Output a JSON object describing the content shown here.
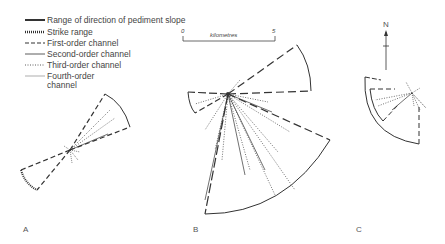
{
  "legend": {
    "items": [
      {
        "label": "Range of direction of pediment slope",
        "style": "solid-thick"
      },
      {
        "label": "Strike range",
        "style": "hatched"
      },
      {
        "label": "First-order channel",
        "style": "dashed"
      },
      {
        "label": "Second-order channel",
        "style": "solid-thin"
      },
      {
        "label": "Third-order channel",
        "style": "dotted"
      },
      {
        "label": "Fourth-order channel",
        "style": "solid-thin-grey"
      }
    ],
    "fourth_line1": "Fourth-order",
    "fourth_line2": "channel"
  },
  "scale_bar": {
    "start": "0",
    "end": "5",
    "unit": "kilometres"
  },
  "north_arrow": {
    "label": "N"
  },
  "panels": [
    {
      "id": "A",
      "label": "A"
    },
    {
      "id": "B",
      "label": "B"
    },
    {
      "id": "C",
      "label": "C"
    }
  ],
  "colors": {
    "line": "#333333",
    "background": "#ffffff"
  }
}
